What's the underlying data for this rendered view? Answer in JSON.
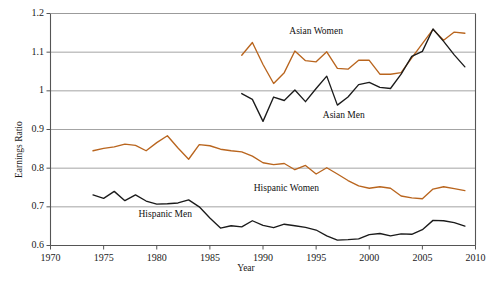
{
  "chart_data": {
    "type": "line",
    "title": "",
    "xlabel": "Year",
    "ylabel": "Earnings Ratio",
    "xlim": [
      1970,
      2010
    ],
    "ylim": [
      0.6,
      1.2
    ],
    "xticks": [
      1970,
      1975,
      1980,
      1985,
      1990,
      1995,
      2000,
      2005,
      2010
    ],
    "yticks": [
      0.6,
      0.7,
      0.8,
      0.9,
      1.0,
      1.1,
      1.2
    ],
    "ytick_labels": [
      "0.6",
      "0.7",
      "0.8",
      "0.9",
      "1",
      "1.1",
      "1.2"
    ],
    "xtick_labels": [
      "1970",
      "1975",
      "1980",
      "1985",
      "1990",
      "1995",
      "2000",
      "2005",
      "2010"
    ],
    "grid": "horizontal",
    "legend_position": "inline-annotations",
    "colors": {
      "asian_women": "#b9651e",
      "asian_men": "#1b1b1b",
      "hispanic_women": "#b9651e",
      "hispanic_men": "#1b1b1b",
      "gridline": "#9a9a9a",
      "axis": "#555555",
      "background": "#ffffff"
    },
    "series": [
      {
        "name": "Asian Women",
        "color": "#b9651e",
        "label_x": 1995.0,
        "label_y": 1.152,
        "x": [
          1988,
          1989,
          1990,
          1991,
          1992,
          1993,
          1994,
          1995,
          1996,
          1997,
          1998,
          1999,
          2000,
          2001,
          2002,
          2003,
          2004,
          2005,
          2006,
          2007,
          2008,
          2009
        ],
        "values": [
          1.092,
          1.125,
          1.068,
          1.019,
          1.047,
          1.103,
          1.078,
          1.075,
          1.101,
          1.058,
          1.056,
          1.079,
          1.079,
          1.043,
          1.043,
          1.047,
          1.085,
          1.122,
          1.159,
          1.131,
          1.152,
          1.149
        ]
      },
      {
        "name": "Asian Men",
        "color": "#1b1b1b",
        "label_x": 1997.6,
        "label_y": 0.936,
        "x": [
          1988,
          1989,
          1990,
          1991,
          1992,
          1993,
          1994,
          1995,
          1996,
          1997,
          1998,
          1999,
          2000,
          2001,
          2002,
          2003,
          2004,
          2005,
          2006,
          2007,
          2008,
          2009
        ],
        "values": [
          0.993,
          0.978,
          0.921,
          0.984,
          0.975,
          1.002,
          0.972,
          1.006,
          1.038,
          0.963,
          0.984,
          1.016,
          1.022,
          1.009,
          1.006,
          1.043,
          1.089,
          1.102,
          1.16,
          1.128,
          1.093,
          1.062
        ]
      },
      {
        "name": "Hispanic Women",
        "color": "#b9651e",
        "label_x": 1992.2,
        "label_y": 0.745,
        "x": [
          1974,
          1975,
          1976,
          1977,
          1978,
          1979,
          1980,
          1981,
          1982,
          1983,
          1984,
          1985,
          1986,
          1987,
          1988,
          1989,
          1990,
          1991,
          1992,
          1993,
          1994,
          1995,
          1996,
          1997,
          1998,
          1999,
          2000,
          2001,
          2002,
          2003,
          2004,
          2005,
          2006,
          2007,
          2008,
          2009
        ],
        "values": [
          0.845,
          0.851,
          0.855,
          0.862,
          0.859,
          0.845,
          0.866,
          0.884,
          0.852,
          0.823,
          0.861,
          0.858,
          0.849,
          0.845,
          0.842,
          0.831,
          0.814,
          0.809,
          0.812,
          0.796,
          0.807,
          0.785,
          0.801,
          0.785,
          0.768,
          0.754,
          0.748,
          0.752,
          0.748,
          0.728,
          0.723,
          0.721,
          0.746,
          0.752,
          0.747,
          0.742
        ]
      },
      {
        "name": "Hispanic Men",
        "color": "#1b1b1b",
        "label_x": 1980.8,
        "label_y": 0.679,
        "x": [
          1974,
          1975,
          1976,
          1977,
          1978,
          1979,
          1980,
          1981,
          1982,
          1983,
          1984,
          1985,
          1986,
          1987,
          1988,
          1989,
          1990,
          1991,
          1992,
          1993,
          1994,
          1995,
          1996,
          1997,
          1998,
          1999,
          2000,
          2001,
          2002,
          2003,
          2004,
          2005,
          2006,
          2007,
          2008,
          2009
        ],
        "values": [
          0.731,
          0.722,
          0.74,
          0.716,
          0.731,
          0.715,
          0.707,
          0.708,
          0.71,
          0.718,
          0.7,
          0.671,
          0.645,
          0.651,
          0.648,
          0.664,
          0.652,
          0.646,
          0.655,
          0.651,
          0.647,
          0.64,
          0.625,
          0.614,
          0.615,
          0.617,
          0.628,
          0.631,
          0.625,
          0.63,
          0.629,
          0.641,
          0.665,
          0.664,
          0.659,
          0.65
        ]
      }
    ],
    "annotations": [
      {
        "text": "Asian Women"
      },
      {
        "text": "Asian Men"
      },
      {
        "text": "Hispanic Women"
      },
      {
        "text": "Hispanic Men"
      }
    ]
  }
}
